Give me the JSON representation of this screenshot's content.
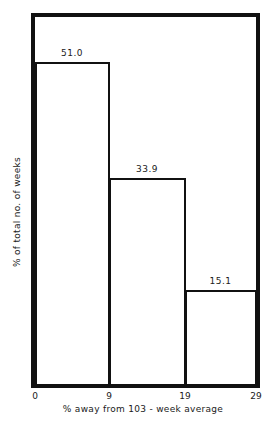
{
  "chart_data": {
    "type": "bar",
    "subtype": "histogram",
    "bins": [
      {
        "from": 0,
        "to": 9,
        "value": 51.0,
        "label": "51.0",
        "px_left": 35,
        "px_right": 109,
        "px_top": 62
      },
      {
        "from": 9,
        "to": 19,
        "value": 33.9,
        "label": "33.9",
        "px_left": 109,
        "px_right": 185,
        "px_top": 178
      },
      {
        "from": 19,
        "to": 29,
        "value": 15.1,
        "label": "15.1",
        "px_left": 185,
        "px_right": 256,
        "px_top": 290
      }
    ],
    "categories": [
      "0-9",
      "9-19",
      "19-29"
    ],
    "values": [
      51.0,
      33.9,
      15.1
    ],
    "xticks": [
      {
        "label": "0",
        "px": 35
      },
      {
        "label": "9",
        "px": 109
      },
      {
        "label": "19",
        "px": 185
      },
      {
        "label": "29",
        "px": 256
      }
    ],
    "title": "",
    "xlabel": "% away from 103 - week average",
    "ylabel": "% of total no. of weeks",
    "xlim": [
      0,
      29
    ],
    "grid": false,
    "legend": null,
    "baseline_px": 384
  }
}
